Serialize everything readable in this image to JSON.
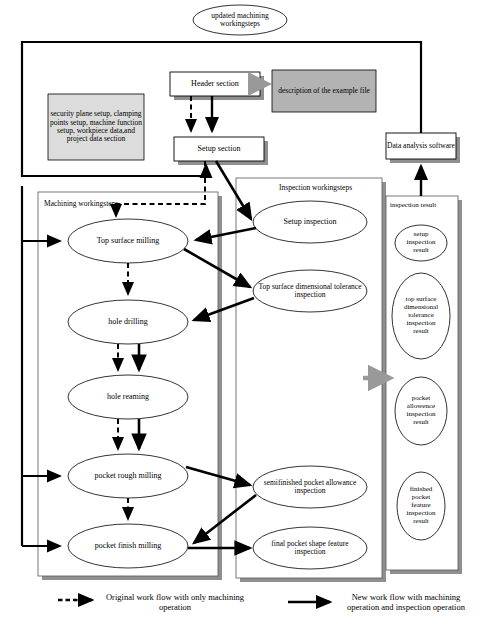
{
  "diagram": {
    "title_ellipse": "updated machining workingsteps",
    "boxes": {
      "header_section": "Header section",
      "setup_section": "Setup section",
      "description": "description of the example file",
      "security_block": "security plane setup, clamping points setup, machine function setup, workpiece data,and project data section",
      "data_analysis": "Data analysis software"
    },
    "containers": {
      "machining": "Machining workingsteps",
      "inspection": "Inspection workingsteps",
      "result": "inspection result"
    },
    "machining_steps": [
      "Top surface milling",
      "hole drilling",
      "hole reaming",
      "pocket rough milling",
      "pocket finish milling"
    ],
    "inspection_steps": [
      "Setup inspection",
      "Top surface dimensional tolerance inspection",
      "semifinished pocket allowance inspection",
      "final pocket shape feature inspection"
    ],
    "result_items": [
      "setup inspection result",
      "top surface dimensional tolerance inspection result",
      "pocket allowence inspection result",
      "finished pocket feature inspection result"
    ],
    "legend": {
      "dashed": "Original work flow with only machining operation",
      "solid": "New work flow with machining operation and inspection operation"
    },
    "colors": {
      "line": "#000000",
      "gray_fill": "#b3b3b3",
      "light_gray_fill": "#d9d9d9",
      "shadow": "#999999",
      "gray_arrow": "#999999"
    }
  }
}
